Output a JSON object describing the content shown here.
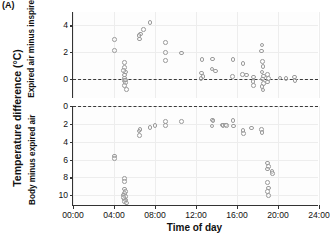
{
  "figure": {
    "panel_letter": "(A)",
    "outer_ylabel": "Temperature difference (°C)",
    "xlabel": "Time of day",
    "marker_color": "#9a9a9a",
    "zeroline_color": "#3a3a3a",
    "grid_color": "#ededed",
    "axis_color": "#333333"
  },
  "chart_data": {
    "type": "scatter",
    "title": "",
    "xlabel": "Time of day",
    "ylabel": "Temperature difference (°C)",
    "xlim": [
      0,
      24
    ],
    "xticks": [
      0,
      4,
      8,
      12,
      16,
      20,
      24
    ],
    "xticklabels": [
      "00:00",
      "04:00",
      "08:00",
      "12:00",
      "16:00",
      "20:00",
      "24:00"
    ],
    "grid": true,
    "legend": null,
    "panels": [
      {
        "name": "expired-minus-inspired",
        "ylabel": "Expired air minus inspired air",
        "ylim": [
          -1.4,
          5.0
        ],
        "yticks": [
          0,
          2,
          4
        ],
        "yticklabels": [
          "0",
          "2",
          "4"
        ],
        "y_inverted": false,
        "reference_line": 0,
        "points": [
          [
            4.05,
            2.95
          ],
          [
            4.05,
            2.15
          ],
          [
            5.05,
            1.25
          ],
          [
            5.0,
            0.85
          ],
          [
            5.1,
            0.55
          ],
          [
            5.0,
            0.3
          ],
          [
            5.05,
            0.1
          ],
          [
            5.0,
            -0.1
          ],
          [
            5.1,
            -0.25
          ],
          [
            5.0,
            -0.45
          ],
          [
            5.15,
            -0.05
          ],
          [
            4.95,
            0.65
          ],
          [
            5.2,
            -0.75
          ],
          [
            6.5,
            3.0
          ],
          [
            6.6,
            3.35
          ],
          [
            6.45,
            3.25
          ],
          [
            6.9,
            3.7
          ],
          [
            7.5,
            4.2
          ],
          [
            9.0,
            2.75
          ],
          [
            9.05,
            2.0
          ],
          [
            9.0,
            1.4
          ],
          [
            10.6,
            1.95
          ],
          [
            12.6,
            1.45
          ],
          [
            12.55,
            0.45
          ],
          [
            12.7,
            0.2
          ],
          [
            12.5,
            0.05
          ],
          [
            13.6,
            1.5
          ],
          [
            13.55,
            0.75
          ],
          [
            13.9,
            0.6
          ],
          [
            15.6,
            1.45
          ],
          [
            15.55,
            0.2
          ],
          [
            16.6,
            1.15
          ],
          [
            16.55,
            0.35
          ],
          [
            16.9,
            0.3
          ],
          [
            17.6,
            0.15
          ],
          [
            17.55,
            -0.15
          ],
          [
            17.6,
            -0.45
          ],
          [
            18.4,
            2.1
          ],
          [
            18.45,
            2.55
          ],
          [
            18.5,
            1.3
          ],
          [
            18.55,
            0.95
          ],
          [
            18.45,
            0.55
          ],
          [
            18.6,
            0.25
          ],
          [
            18.5,
            0.0
          ],
          [
            18.6,
            -0.3
          ],
          [
            18.45,
            -0.55
          ],
          [
            18.55,
            -0.8
          ],
          [
            19.0,
            0.35
          ],
          [
            19.05,
            0.05
          ],
          [
            18.95,
            -0.2
          ],
          [
            20.2,
            0.1
          ],
          [
            20.8,
            0.05
          ],
          [
            21.6,
            0.15
          ],
          [
            21.65,
            -0.1
          ]
        ]
      },
      {
        "name": "body-minus-expired",
        "ylabel": "Body minus expired air",
        "ylim": [
          0,
          11.2
        ],
        "yticks": [
          0,
          2,
          4,
          6,
          8,
          10
        ],
        "yticklabels": [
          "0",
          "2",
          "4",
          "6",
          "8",
          "10"
        ],
        "y_inverted": true,
        "reference_line": 0,
        "points": [
          [
            4.05,
            5.6
          ],
          [
            4.05,
            5.9
          ],
          [
            5.0,
            8.1
          ],
          [
            5.05,
            8.45
          ],
          [
            5.0,
            9.3
          ],
          [
            5.1,
            9.55
          ],
          [
            5.05,
            9.8
          ],
          [
            4.95,
            9.95
          ],
          [
            5.1,
            10.15
          ],
          [
            5.0,
            10.4
          ],
          [
            5.15,
            10.55
          ],
          [
            5.05,
            10.7
          ],
          [
            5.2,
            10.85
          ],
          [
            4.95,
            10.25
          ],
          [
            6.5,
            3.3
          ],
          [
            6.55,
            2.65
          ],
          [
            6.45,
            2.8
          ],
          [
            7.5,
            2.4
          ],
          [
            8.0,
            2.2
          ],
          [
            9.0,
            1.75
          ],
          [
            9.05,
            2.2
          ],
          [
            10.6,
            1.75
          ],
          [
            13.6,
            1.55
          ],
          [
            13.65,
            1.7
          ],
          [
            13.55,
            2.25
          ],
          [
            14.6,
            2.15
          ],
          [
            14.65,
            2.2
          ],
          [
            14.9,
            2.15
          ],
          [
            14.95,
            2.2
          ],
          [
            15.6,
            1.6
          ],
          [
            15.65,
            2.25
          ],
          [
            16.6,
            2.75
          ],
          [
            16.65,
            3.1
          ],
          [
            17.4,
            2.45
          ],
          [
            18.4,
            2.6
          ],
          [
            18.45,
            3.0
          ],
          [
            19.0,
            6.4
          ],
          [
            19.05,
            6.75
          ],
          [
            19.0,
            7.05
          ],
          [
            19.4,
            7.35
          ],
          [
            19.45,
            7.55
          ],
          [
            19.0,
            8.6
          ],
          [
            19.05,
            9.2
          ],
          [
            19.0,
            9.55
          ],
          [
            19.05,
            10.0
          ]
        ]
      }
    ]
  }
}
